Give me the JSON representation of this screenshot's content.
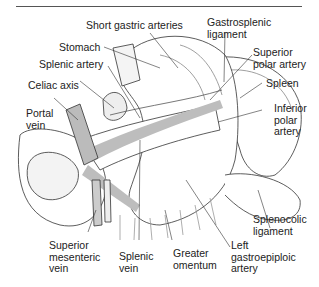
{
  "figure": {
    "colors": {
      "line": "#333333",
      "vessel_fill": "#bdbdbd",
      "background": "#ffffff"
    },
    "labels": {
      "short_gastric_arteries": "Short gastric arteries",
      "gastrosplenic_ligament": "Gastrosplenic\nligament",
      "stomach": "Stomach",
      "splenic_artery": "Splenic artery",
      "superior_polar_artery": "Superior\npolar artery",
      "celiac_axis": "Celiac axis",
      "spleen": "Spleen",
      "portal_vein": "Portal\nvein",
      "inferior_polar_artery": "Inferior\npolar\nartery",
      "splenocolic_ligament": "Splenocolic\nligament",
      "superior_mesenteric_vein": "Superior\nmesenteric\nvein",
      "splenic_vein": "Splenic\nvein",
      "greater_omentum": "Greater\nomentum",
      "left_gastroepiploic_artery": "Left\ngastroepiploic\nartery"
    }
  }
}
